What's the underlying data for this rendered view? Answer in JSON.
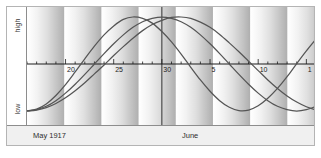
{
  "axis": {
    "y_high_label": "high",
    "y_low_label": "low"
  },
  "months": {
    "left_label": "May 1917",
    "right_label": "June"
  },
  "chart_data": {
    "type": "line",
    "title": "",
    "subtitle": "",
    "xlabel": "",
    "ylabel": "",
    "grid": false,
    "legend_position": "none",
    "axis_colors": {
      "curve": "#555555",
      "axis": "#1c1c1c",
      "frame": "#b4b4b4",
      "band_light": "#ffffff",
      "band_dark": "#b0b0b0",
      "month_band": "#f0f0f0"
    },
    "ylim": [
      -1,
      1
    ],
    "ytick_labels": [
      "high",
      "low"
    ],
    "xlim": [
      0,
      30
    ],
    "xtick_labels": [
      "20",
      "25",
      "30",
      "5",
      "10",
      "1"
    ],
    "xtick_positions": [
      4,
      9,
      14,
      19,
      24,
      29
    ],
    "month_divider_x": 14,
    "series": [
      {
        "name": "physical",
        "period_days": 23,
        "phase_start": "minimum",
        "values": [
          -1.0,
          -0.96,
          -0.85,
          -0.67,
          -0.44,
          -0.17,
          0.11,
          0.38,
          0.62,
          0.81,
          0.95,
          1.0,
          0.97,
          0.87,
          0.69,
          0.47,
          0.21,
          -0.07,
          -0.34,
          -0.58,
          -0.78,
          -0.92,
          -0.99,
          -0.98,
          -0.89,
          -0.73,
          -0.52,
          -0.27,
          0.01,
          0.28,
          0.53
        ]
      },
      {
        "name": "emotional",
        "period_days": 28,
        "phase_start": "minimum",
        "values": [
          -1.0,
          -0.97,
          -0.9,
          -0.78,
          -0.62,
          -0.43,
          -0.22,
          0.0,
          0.22,
          0.43,
          0.62,
          0.78,
          0.9,
          0.97,
          1.0,
          0.97,
          0.9,
          0.78,
          0.62,
          0.43,
          0.22,
          0.0,
          -0.22,
          -0.43,
          -0.62,
          -0.78,
          -0.9,
          -0.97,
          -1.0,
          -0.97,
          -0.9
        ]
      },
      {
        "name": "intellectual",
        "period_days": 33,
        "phase_start": "minimum",
        "values": [
          -1.0,
          -0.98,
          -0.93,
          -0.84,
          -0.72,
          -0.57,
          -0.4,
          -0.21,
          -0.02,
          0.18,
          0.37,
          0.55,
          0.71,
          0.84,
          0.93,
          0.99,
          1.0,
          0.97,
          0.89,
          0.78,
          0.63,
          0.45,
          0.26,
          0.06,
          -0.14,
          -0.34,
          -0.52,
          -0.68,
          -0.81,
          -0.91,
          -0.98
        ]
      }
    ]
  }
}
